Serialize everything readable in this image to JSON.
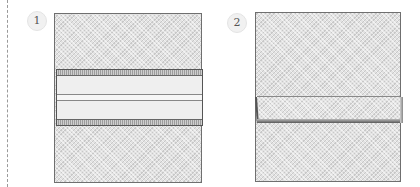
{
  "figure": {
    "type": "instructional-fold-diagram",
    "steps": [
      {
        "number": "1",
        "description": "Square sheet with a horizontal band folded across the middle; band has dark hatched strips at top and bottom edges and a center crease line",
        "elements": [
          "sheet",
          "horizontal-band",
          "top-strip",
          "center-crease",
          "bottom-strip"
        ]
      },
      {
        "number": "2",
        "description": "Square sheet with a single horizontal fold flap across the middle, shaded lower edge",
        "elements": [
          "sheet",
          "fold-flap",
          "fold-shadow"
        ]
      }
    ],
    "colors": {
      "sheet_fill": "#e2e2e2",
      "outline": "#6f6f6f",
      "band_fill": "#efefef",
      "strip_fill": "#9c9c9c",
      "shadow_dark": "#5a5a5a",
      "divider": "#9a9a9a"
    }
  }
}
